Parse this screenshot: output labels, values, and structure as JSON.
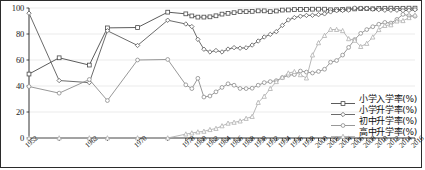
{
  "chart_data": {
    "type": "line",
    "title": "",
    "xlabel": "",
    "ylabel": "",
    "ylim": [
      0,
      100
    ],
    "yticks": [
      0,
      20,
      40,
      60,
      80,
      100
    ],
    "grid": true,
    "legend_position": "bottom-right",
    "x": [
      1952,
      1957,
      1962,
      1965,
      1970,
      1975,
      1978,
      1979,
      1980,
      1981,
      1982,
      1983,
      1984,
      1985,
      1986,
      1987,
      1988,
      1989,
      1990,
      1991,
      1992,
      1993,
      1994,
      1995,
      1996,
      1997,
      1998,
      1999,
      2000,
      2001,
      2002,
      2003,
      2004,
      2005,
      2006,
      2007,
      2008,
      2009,
      2010,
      2011,
      2012,
      2013,
      2014,
      2015,
      2016
    ],
    "xtick_labels": [
      "1952",
      "1962",
      "1970",
      "1978",
      "1980",
      "1982",
      "1984",
      "1986",
      "1988",
      "1990",
      "1992",
      "1994",
      "1996",
      "1998",
      "2000",
      "2002",
      "2004",
      "2006",
      "2008",
      "2010",
      "2012",
      "2014",
      "2016"
    ],
    "series": [
      {
        "name": "小学入学率(%)",
        "color": "#4a4a4a",
        "marker": "square",
        "values": [
          49.2,
          61.7,
          56.1,
          84.7,
          85.0,
          96.8,
          95.5,
          93.9,
          93.0,
          93.0,
          93.2,
          94.0,
          95.3,
          95.9,
          96.4,
          97.2,
          97.2,
          97.4,
          97.8,
          97.8,
          97.2,
          97.7,
          98.4,
          98.5,
          98.8,
          98.9,
          98.9,
          99.1,
          99.1,
          99.1,
          98.6,
          98.7,
          98.9,
          99.2,
          99.3,
          99.5,
          99.5,
          99.4,
          99.7,
          99.8,
          99.9,
          99.7,
          99.8,
          99.9,
          99.9
        ]
      },
      {
        "name": "小学升学率(%)",
        "color": "#5a5a5a",
        "marker": "diamond",
        "values": [
          96.0,
          44.2,
          42.6,
          82.5,
          71.2,
          90.6,
          87.7,
          85.7,
          75.9,
          68.3,
          66.2,
          67.3,
          66.2,
          68.4,
          69.5,
          69.1,
          69.4,
          71.5,
          74.6,
          77.7,
          79.7,
          81.8,
          86.6,
          90.8,
          92.6,
          93.7,
          94.3,
          94.4,
          94.9,
          95.5,
          97.0,
          97.9,
          98.1,
          98.4,
          100.0,
          99.9,
          99.7,
          99.1,
          98.7,
          98.3,
          98.3,
          98.3,
          98.0,
          98.2,
          98.7
        ]
      },
      {
        "name": "初中升学率(%)",
        "color": "#8c8c8c",
        "marker": "circle",
        "values": [
          39.6,
          34.5,
          45.0,
          28.8,
          60.0,
          60.4,
          40.9,
          38.0,
          45.9,
          31.5,
          32.3,
          35.5,
          38.9,
          41.7,
          40.6,
          38.1,
          38.0,
          38.3,
          40.6,
          42.6,
          43.4,
          44.1,
          46.4,
          48.3,
          48.8,
          51.5,
          50.7,
          50.0,
          51.2,
          52.9,
          58.3,
          59.6,
          63.8,
          69.7,
          75.7,
          80.5,
          83.4,
          85.6,
          87.5,
          88.9,
          88.4,
          91.2,
          95.1,
          94.1,
          93.7
        ]
      },
      {
        "name": "高中升学率(%)",
        "color": "#b0b0b0",
        "marker": "triangle",
        "values": [
          0.0,
          0.0,
          0.0,
          0.0,
          0.0,
          0.0,
          3.0,
          3.8,
          4.6,
          5.1,
          6.4,
          7.3,
          9.3,
          11.3,
          12.0,
          13.0,
          15.0,
          16.5,
          27.3,
          32.0,
          38.0,
          43.3,
          46.7,
          49.9,
          51.0,
          48.6,
          46.1,
          63.8,
          73.2,
          78.8,
          83.5,
          83.4,
          82.5,
          76.3,
          75.1,
          70.3,
          72.7,
          77.6,
          83.3,
          86.5,
          87.0,
          89.9,
          90.2,
          92.5,
          94.5
        ]
      }
    ]
  }
}
